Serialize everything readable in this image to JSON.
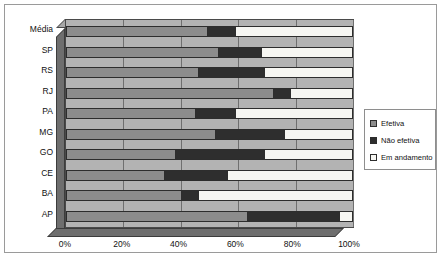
{
  "chart_data": {
    "type": "bar",
    "orientation": "horizontal",
    "stacked": true,
    "normalized_percent": true,
    "title": "",
    "subtitle": "",
    "xlabel": "",
    "ylabel": "",
    "xlim": [
      0,
      100
    ],
    "xticks": [
      "0%",
      "20%",
      "40%",
      "60%",
      "80%",
      "100%"
    ],
    "xtick_values": [
      0,
      20,
      40,
      60,
      80,
      100
    ],
    "grid": true,
    "legend_position": "right",
    "categories": [
      "Média",
      "SP",
      "RS",
      "RJ",
      "PA",
      "MG",
      "GO",
      "CE",
      "BA",
      "AP"
    ],
    "series": [
      {
        "name": "Efetiva",
        "color": "#8c8c8c",
        "values": [
          49,
          53,
          46,
          72,
          45,
          52,
          38,
          34,
          40,
          63
        ]
      },
      {
        "name": "Não efetiva",
        "color": "#2e2e2e",
        "values": [
          10,
          15,
          23,
          6,
          14,
          24,
          31,
          22,
          6,
          32
        ]
      },
      {
        "name": "Em andamento",
        "color": "#f6f6f2",
        "values": [
          41,
          32,
          31,
          22,
          41,
          24,
          31,
          44,
          54,
          5
        ]
      }
    ]
  },
  "legend": {
    "items": [
      {
        "label": "Efetiva",
        "swatch": "#8c8c8c"
      },
      {
        "label": "Não efetiva",
        "swatch": "#2e2e2e"
      },
      {
        "label": "Em andamento",
        "swatch": "#f6f6f2"
      }
    ]
  }
}
